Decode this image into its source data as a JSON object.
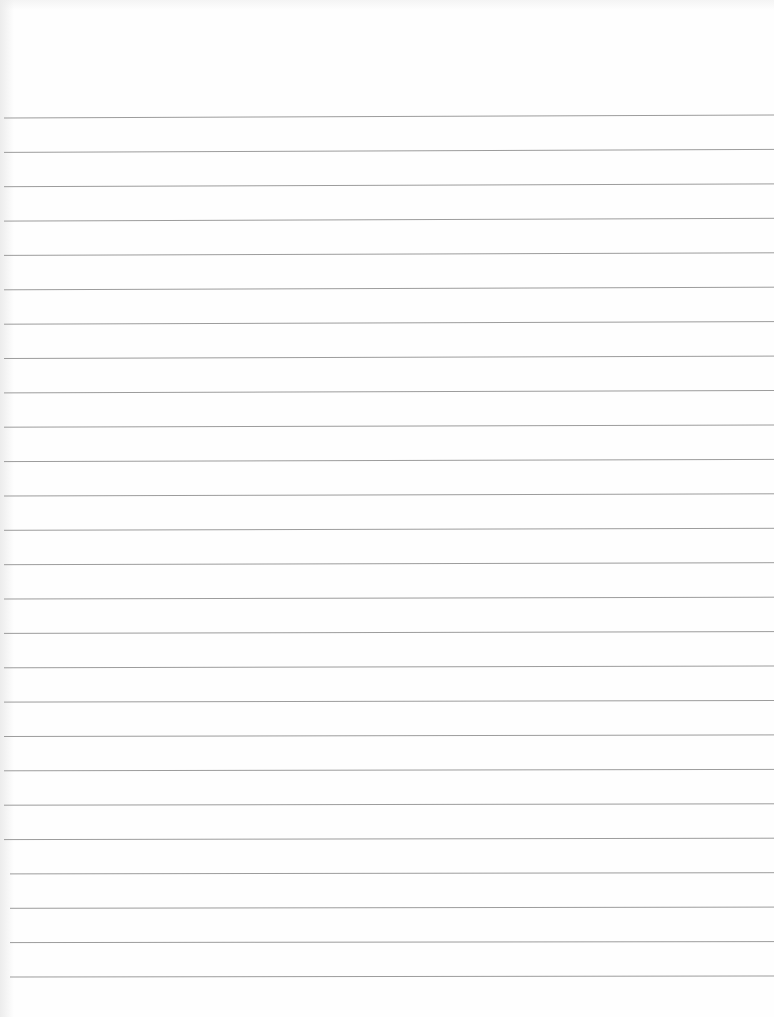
{
  "page": {
    "type": "lined-paper",
    "background_color": "#fefefe",
    "line_color": "#9c9c9c",
    "line_count": 26,
    "first_line_y_left": 118,
    "first_line_y_right": 115,
    "last_line_y_left": 977,
    "last_line_y_right": 976,
    "line_start_x": 4,
    "line_end_x": 774
  }
}
